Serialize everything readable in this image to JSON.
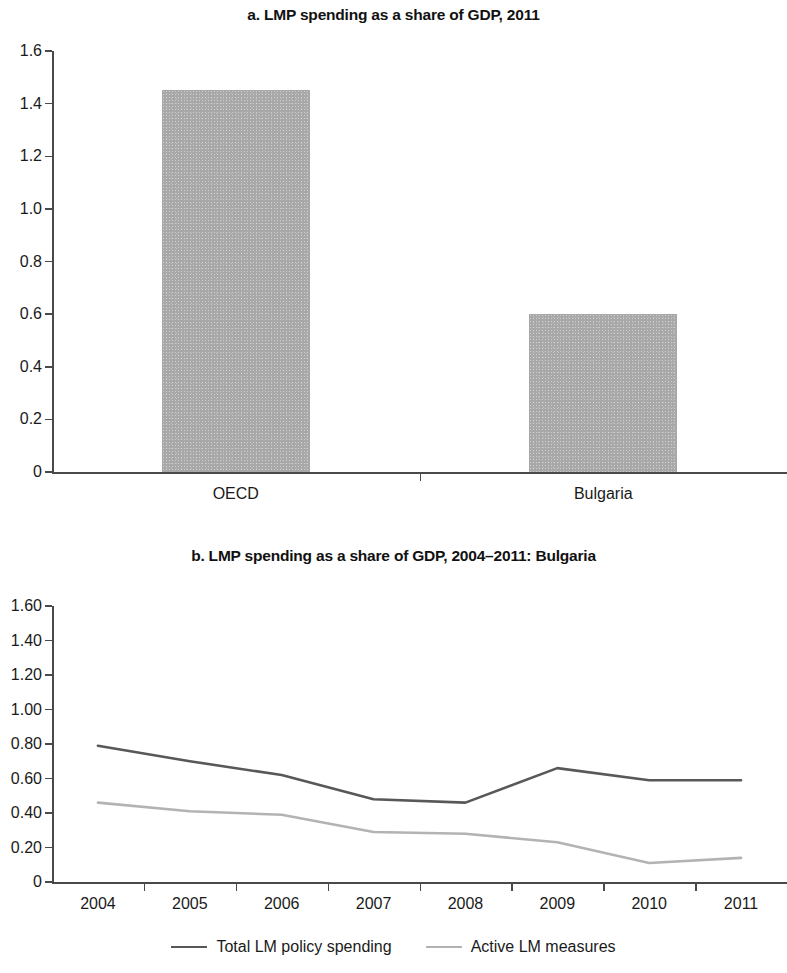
{
  "figure": {
    "panel_a_title": "a. LMP spending as a share of GDP, 2011",
    "panel_b_title": "b. LMP spending as a share of GDP, 2004–2011: Bulgaria"
  },
  "colors": {
    "bar_fill": "#a8a8a8",
    "axis": "#4a4a4a",
    "total_line": "#58585a",
    "active_line": "#b3b3b3",
    "text": "#1a1a1a"
  },
  "legend": {
    "items": [
      {
        "label": "Total LM policy spending",
        "color": "#58585a"
      },
      {
        "label": "Active LM measures",
        "color": "#b3b3b3"
      }
    ]
  },
  "chart_data": [
    {
      "type": "bar",
      "title": "a. LMP spending as a share of GDP, 2011",
      "xlabel": "",
      "ylabel": "",
      "categories": [
        "OECD",
        "Bulgaria"
      ],
      "values": [
        1.45,
        0.6
      ],
      "ylim": [
        0,
        1.6
      ],
      "yticks": [
        0,
        0.2,
        0.4,
        0.6,
        0.8,
        1.0,
        1.2,
        1.4,
        1.6
      ],
      "ytick_labels": [
        "0",
        "0.2",
        "0.4",
        "0.6",
        "0.8",
        "1.0",
        "1.2",
        "1.4",
        "1.6"
      ],
      "grid": false,
      "legend": "none"
    },
    {
      "type": "line",
      "title": "b. LMP spending as a share of GDP, 2004–2011: Bulgaria",
      "xlabel": "",
      "ylabel": "",
      "x": [
        "2004",
        "2005",
        "2006",
        "2007",
        "2008",
        "2009",
        "2010",
        "2011"
      ],
      "series": [
        {
          "name": "Total LM policy spending",
          "color": "#58585a",
          "values": [
            0.79,
            0.7,
            0.62,
            0.48,
            0.46,
            0.66,
            0.59,
            0.59
          ]
        },
        {
          "name": "Active LM measures",
          "color": "#b3b3b3",
          "values": [
            0.46,
            0.41,
            0.39,
            0.29,
            0.28,
            0.23,
            0.11,
            0.14
          ]
        }
      ],
      "ylim": [
        0,
        1.6
      ],
      "yticks": [
        0,
        0.2,
        0.4,
        0.6,
        0.8,
        1.0,
        1.2,
        1.4,
        1.6
      ],
      "ytick_labels": [
        "0",
        "0.20",
        "0.40",
        "0.60",
        "0.80",
        "1.00",
        "1.20",
        "1.40",
        "1.60"
      ],
      "grid": false,
      "legend": "bottom-center"
    }
  ]
}
